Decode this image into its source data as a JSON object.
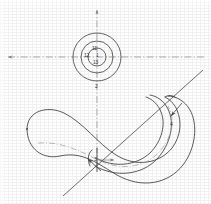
{
  "figure": {
    "kind": "patent-line-drawing",
    "background_color": "#ffffff",
    "line_color": "#4a4a4a",
    "centerline_color": "#8a8a8a",
    "label_color": "#3a3a3a",
    "width": 211,
    "height": 204
  },
  "centerlines": {
    "horizontal": {
      "name": "horizontal-centerline",
      "style": "dash-dot",
      "y": 57,
      "x_start": 6,
      "x_end": 206,
      "arrow_left": true,
      "arrow_right": true
    },
    "vertical": {
      "name": "vertical-centerline",
      "style": "dash-dot",
      "x": 97,
      "y_start": 8,
      "y_end": 168,
      "arrow_top": true,
      "arrow_bottom": false
    }
  },
  "circles": {
    "name": "concentric-bore",
    "center_x": 97,
    "center_y": 57,
    "outer_radius": 24,
    "middle_radius": 16,
    "inner_radius": 9
  },
  "section_line": {
    "name": "section-cut-line",
    "x1": 63,
    "y1": 196,
    "x2": 203,
    "y2": 70
  },
  "labels": [
    {
      "name": "label-bore-upper",
      "text": "11",
      "x": 94,
      "y": 50
    },
    {
      "name": "label-bore-left",
      "text": "12",
      "x": 86,
      "y": 56
    },
    {
      "name": "label-bore-center",
      "text": "1",
      "x": 96,
      "y": 56
    },
    {
      "name": "label-bore-lower",
      "text": "13",
      "x": 94,
      "y": 62
    },
    {
      "name": "label-axis-lower",
      "text": "2",
      "x": 95,
      "y": 87
    },
    {
      "name": "label-body-left",
      "text": "3",
      "x": 95,
      "y": 160
    },
    {
      "name": "label-body-right",
      "text": "4",
      "x": 171,
      "y": 125
    }
  ],
  "leaders": [
    {
      "name": "leader-left-arrow",
      "x1": 100,
      "y1": 170,
      "x2": 88,
      "y2": 159,
      "head": "end"
    },
    {
      "name": "leader-right-arrow",
      "x1": 181,
      "y1": 104,
      "x2": 171,
      "y2": 117,
      "head": "end"
    }
  ],
  "body": {
    "name": "crescent-body",
    "description": "Hollow curved crescent tube drawn with outer, inner and wall contour lines plus a dash-dot arc centerline"
  }
}
